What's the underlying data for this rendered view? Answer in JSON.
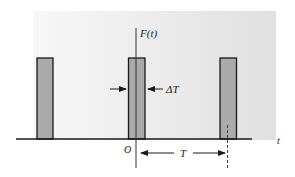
{
  "diagram": {
    "labels": {
      "function": "F(t)",
      "time_axis": "t",
      "origin": "O",
      "pulse_width": "ΔT",
      "period": "T"
    },
    "colors": {
      "background_panel": "#e6e6e6",
      "pulse_fill": "#a9a9a9",
      "line": "#1a1a1a"
    },
    "pulses": [
      {
        "index": 1,
        "position": "left"
      },
      {
        "index": 2,
        "position": "center (at origin)"
      },
      {
        "index": 3,
        "position": "right"
      }
    ]
  }
}
